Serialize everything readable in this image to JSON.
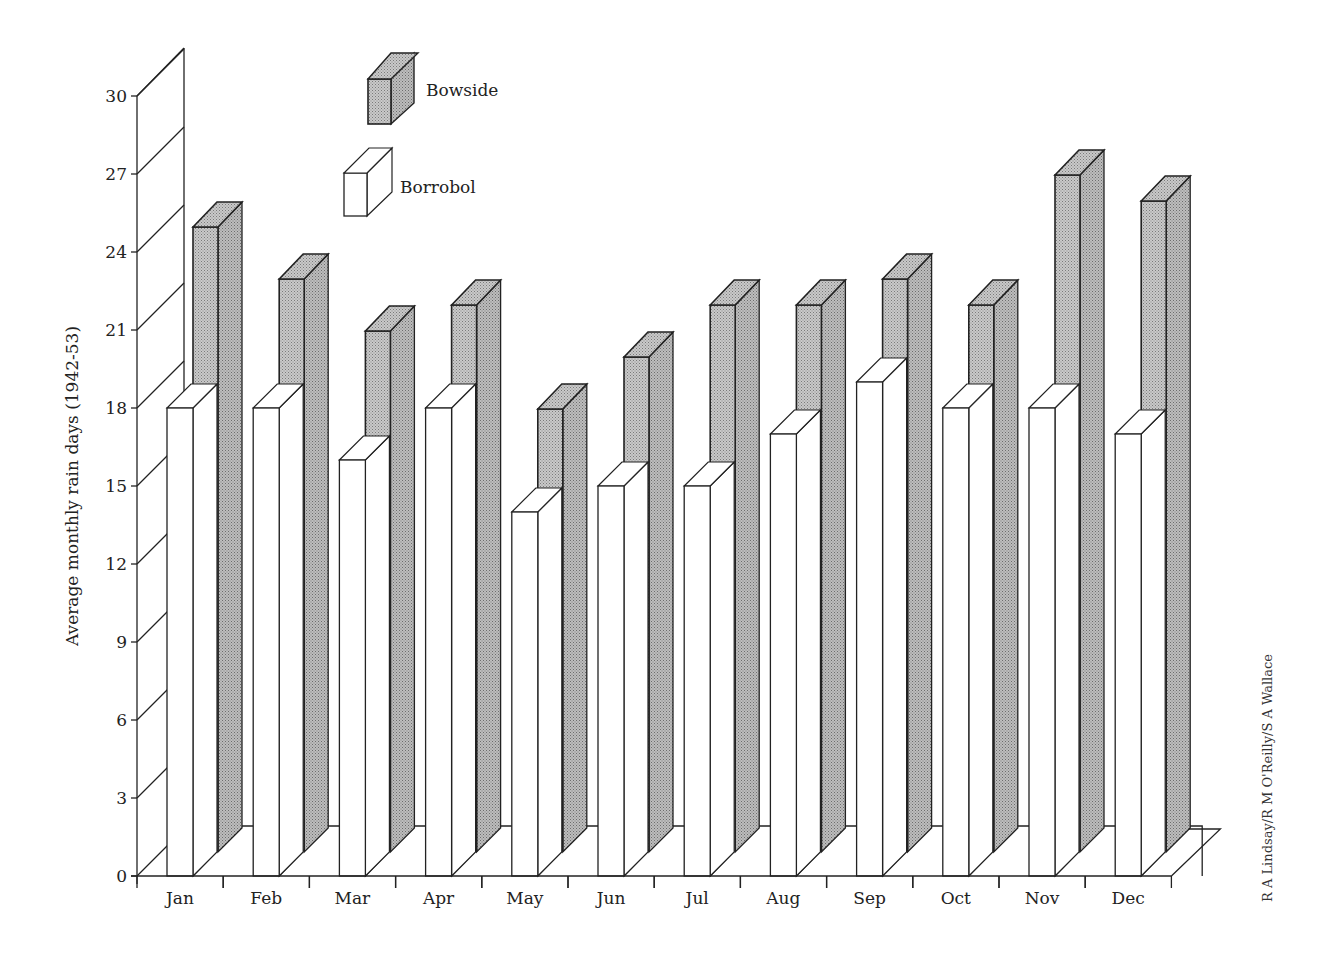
{
  "chart_data": {
    "type": "bar",
    "style": "3d-grouped-bar",
    "title": "",
    "xlabel": "",
    "ylabel": "Average monthly rain days (1942-53)",
    "ylim": [
      0,
      30
    ],
    "yticks": [
      0,
      3,
      6,
      9,
      12,
      15,
      18,
      21,
      24,
      27,
      30
    ],
    "grid": true,
    "legend_position": "top-left-inside",
    "categories": [
      "Jan",
      "Feb",
      "Mar",
      "Apr",
      "May",
      "Jun",
      "Jul",
      "Aug",
      "Sep",
      "Oct",
      "Nov",
      "Dec"
    ],
    "series": [
      {
        "name": "Bowside",
        "fill": "shaded-grey",
        "position": "back",
        "values": [
          24,
          22,
          20,
          21,
          17,
          19,
          21,
          21,
          22,
          21,
          26,
          25
        ]
      },
      {
        "name": "Borrobol",
        "fill": "white",
        "position": "front",
        "values": [
          18,
          18,
          16,
          18,
          14,
          15,
          15,
          17,
          19,
          18,
          18,
          17
        ]
      }
    ],
    "credit": "R A Lindsay/R M O'Reilly/S A Wallace"
  },
  "colors": {
    "bowside_face": "#b8b8b8",
    "bowside_side": "#a9a9a9",
    "bowside_top": "#c6c6c6",
    "borrobol_face": "#ffffff",
    "stroke": "#222222"
  }
}
